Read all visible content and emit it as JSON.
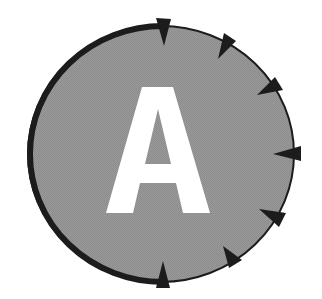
{
  "emblem": {
    "letter": "A",
    "colors": {
      "fill": "#959595",
      "stroke": "#1c1c1c",
      "letter": "#ffffff",
      "background": "#ffffff"
    },
    "arrow_count": 7
  }
}
